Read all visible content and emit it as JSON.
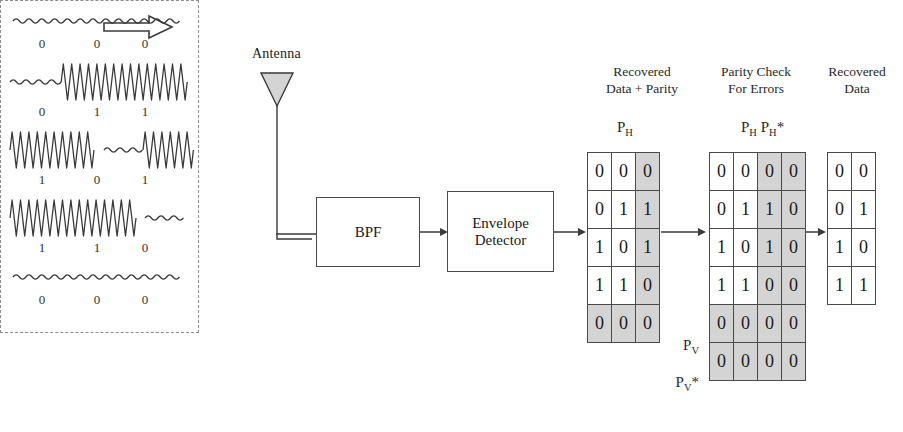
{
  "diagram": {
    "title_flow_arrow": "flow-direction-arrow",
    "antenna_label": "Antenna",
    "blocks": [
      {
        "id": "bpf",
        "label": "BPF"
      },
      {
        "id": "envelope-detector",
        "label_line1": "Envelope",
        "label_line2": "Detector"
      }
    ],
    "waveform_panel": {
      "description": "OOK / ASK modulated received waveforms with decoded bits",
      "rows": [
        {
          "bits": [
            "0",
            "0",
            "0"
          ],
          "segments": [
            "low",
            "low",
            "low"
          ]
        },
        {
          "bits": [
            "0",
            "1",
            "1"
          ],
          "segments": [
            "low",
            "high",
            "high"
          ]
        },
        {
          "bits": [
            "1",
            "0",
            "1"
          ],
          "segments": [
            "high",
            "low",
            "high"
          ]
        },
        {
          "bits": [
            "1",
            "1",
            "0"
          ],
          "segments": [
            "high",
            "high",
            "low"
          ]
        },
        {
          "bits": [
            "0",
            "0",
            "0"
          ],
          "segments": [
            "low",
            "low",
            "low"
          ]
        }
      ]
    },
    "matrices": [
      {
        "id": "recovered-data-plus-parity",
        "caption_line1": "Recovered",
        "caption_line2": "Data + Parity",
        "sub_label": "P",
        "sub_label_sub": "H",
        "rows": [
          {
            "cells": [
              "0",
              "0",
              "0"
            ],
            "shaded": [
              false,
              false,
              true
            ]
          },
          {
            "cells": [
              "0",
              "1",
              "1"
            ],
            "shaded": [
              false,
              false,
              true
            ]
          },
          {
            "cells": [
              "1",
              "0",
              "1"
            ],
            "shaded": [
              false,
              false,
              true
            ]
          },
          {
            "cells": [
              "1",
              "1",
              "0"
            ],
            "shaded": [
              false,
              false,
              true
            ]
          },
          {
            "cells": [
              "0",
              "0",
              "0"
            ],
            "shaded": [
              true,
              true,
              true
            ]
          }
        ]
      },
      {
        "id": "parity-check-for-errors",
        "caption_line1": "Parity Check",
        "caption_line2": "For Errors",
        "sub_label": "P",
        "sub_label_sub": "H",
        "sub_label2": "P",
        "sub_label2_sub": "H",
        "sub_label2_star": "*",
        "row_label_pv": "P",
        "row_label_pv_sub": "V",
        "row_label_pvstar": "P",
        "row_label_pvstar_sub": "V",
        "row_label_pvstar_star": "*",
        "rows": [
          {
            "cells": [
              "0",
              "0",
              "0",
              "0"
            ],
            "shaded": [
              false,
              false,
              true,
              true
            ]
          },
          {
            "cells": [
              "0",
              "1",
              "1",
              "0"
            ],
            "shaded": [
              false,
              false,
              true,
              true
            ]
          },
          {
            "cells": [
              "1",
              "0",
              "1",
              "0"
            ],
            "shaded": [
              false,
              false,
              true,
              true
            ]
          },
          {
            "cells": [
              "1",
              "1",
              "0",
              "0"
            ],
            "shaded": [
              false,
              false,
              true,
              true
            ]
          },
          {
            "cells": [
              "0",
              "0",
              "0",
              "0"
            ],
            "shaded": [
              true,
              true,
              true,
              true
            ]
          },
          {
            "cells": [
              "0",
              "0",
              "0",
              "0"
            ],
            "shaded": [
              true,
              true,
              true,
              true
            ]
          }
        ]
      },
      {
        "id": "recovered-data",
        "caption_line1": "Recovered",
        "caption_line2": "Data",
        "rows": [
          {
            "cells": [
              "0",
              "0"
            ],
            "shaded": [
              false,
              false
            ]
          },
          {
            "cells": [
              "0",
              "1"
            ],
            "shaded": [
              false,
              false
            ]
          },
          {
            "cells": [
              "1",
              "0"
            ],
            "shaded": [
              false,
              false
            ]
          },
          {
            "cells": [
              "1",
              "1"
            ],
            "shaded": [
              false,
              false
            ]
          }
        ]
      }
    ],
    "colors": {
      "stroke": "#4a4a4a",
      "shaded_cell": "#d4d4d4",
      "dashed_border": "#8d8d8d",
      "antenna_fill": "#d4d4d4",
      "background": "#ffffff"
    }
  }
}
